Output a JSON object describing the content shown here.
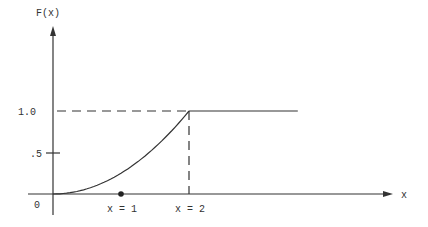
{
  "chart_data": {
    "type": "line",
    "title": "",
    "ylabel": "F(x)",
    "xlabel": "x",
    "origin_label": "0",
    "yticks": [
      {
        "label": ".5",
        "value": 0.5
      },
      {
        "label": "1.0",
        "value": 1.0
      }
    ],
    "xmarks": [
      {
        "label": "x = 1",
        "value": 1,
        "marker": "dot"
      },
      {
        "label": "x = 2",
        "value": 2,
        "marker": "dashed-guide"
      }
    ],
    "series": [
      {
        "name": "F(x) = x^2/4 for 0<=x<=2",
        "style": "solid-curve",
        "x": [
          0,
          0.25,
          0.5,
          0.75,
          1.0,
          1.25,
          1.5,
          1.75,
          2.0
        ],
        "y": [
          0,
          0.0156,
          0.0625,
          0.1406,
          0.25,
          0.3906,
          0.5625,
          0.7656,
          1.0
        ]
      },
      {
        "name": "F(x) = 1 for x>2",
        "style": "solid-line",
        "x": [
          2.0,
          3.6
        ],
        "y": [
          1.0,
          1.0
        ]
      }
    ],
    "guides": [
      {
        "type": "horizontal-dashed",
        "y": 1.0,
        "from_x": 0,
        "to_x": 2
      },
      {
        "type": "vertical-dashed",
        "x": 2,
        "from_y": 0,
        "to_y": 1.0
      }
    ],
    "xlim": [
      0,
      5.1
    ],
    "ylim": [
      0,
      1.95
    ],
    "grid": false,
    "legend": "none"
  },
  "colors": {
    "ink": "#333333",
    "background": "#ffffff"
  }
}
